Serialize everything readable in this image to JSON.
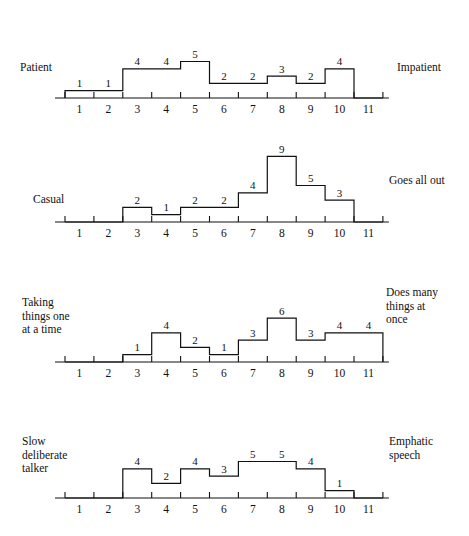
{
  "figure": {
    "background": "#ffffff",
    "ink": "#111111",
    "scale_min": 1,
    "scale_max": 11
  },
  "chart_data": [
    {
      "type": "bar",
      "title": "",
      "left_label": "Patient",
      "right_label": "Impatient",
      "xlabel": "",
      "ylabel": "",
      "categories": [
        "1",
        "2",
        "3",
        "4",
        "5",
        "6",
        "7",
        "8",
        "9",
        "10",
        "11"
      ],
      "values": [
        1,
        1,
        4,
        4,
        5,
        2,
        2,
        3,
        2,
        4,
        0
      ],
      "bar_labels": [
        "1",
        "1",
        "4",
        "4",
        "5",
        "2",
        "2",
        "3",
        "2",
        "4",
        ""
      ],
      "ylim": [
        0,
        9
      ],
      "grid": false,
      "legend": "none"
    },
    {
      "type": "bar",
      "title": "",
      "left_label": "Casual",
      "right_label": "Goes all out",
      "xlabel": "",
      "ylabel": "",
      "categories": [
        "1",
        "2",
        "3",
        "4",
        "5",
        "6",
        "7",
        "8",
        "9",
        "10",
        "11"
      ],
      "values": [
        0,
        0,
        2,
        1,
        2,
        2,
        4,
        9,
        5,
        3,
        0
      ],
      "bar_labels": [
        "",
        "",
        "2",
        "1",
        "2",
        "2",
        "4",
        "9",
        "5",
        "3",
        ""
      ],
      "ylim": [
        0,
        9
      ],
      "grid": false,
      "legend": "none"
    },
    {
      "type": "bar",
      "title": "",
      "left_label": "Taking\nthings one\nat a time",
      "right_label": "Does many\nthings at\nonce",
      "xlabel": "",
      "ylabel": "",
      "categories": [
        "1",
        "2",
        "3",
        "4",
        "5",
        "6",
        "7",
        "8",
        "9",
        "10",
        "11"
      ],
      "values": [
        0,
        0,
        1,
        4,
        2,
        1,
        3,
        6,
        3,
        4,
        4
      ],
      "bar_labels": [
        "",
        "",
        "1",
        "4",
        "2",
        "1",
        "3",
        "6",
        "3",
        "4",
        "4"
      ],
      "ylim": [
        0,
        9
      ],
      "grid": false,
      "legend": "none"
    },
    {
      "type": "bar",
      "title": "",
      "left_label": "Slow\ndeliberate\ntalker",
      "right_label": "Emphatic\nspeech",
      "xlabel": "",
      "ylabel": "",
      "categories": [
        "1",
        "2",
        "3",
        "4",
        "5",
        "6",
        "7",
        "8",
        "9",
        "10",
        "11"
      ],
      "values": [
        0,
        0,
        4,
        2,
        4,
        3,
        5,
        5,
        4,
        1,
        0
      ],
      "bar_labels": [
        "",
        "",
        "4",
        "2",
        "4",
        "3",
        "5",
        "5",
        "4",
        "1",
        ""
      ],
      "ylim": [
        0,
        9
      ],
      "grid": false,
      "legend": "none"
    }
  ]
}
